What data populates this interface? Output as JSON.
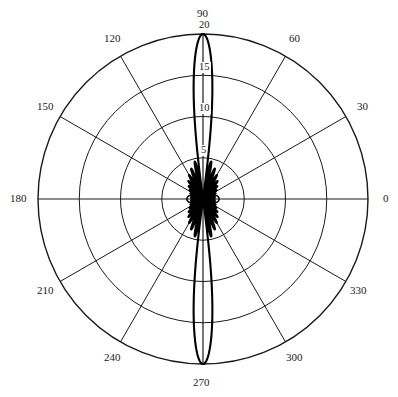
{
  "chart_data": {
    "type": "line",
    "subtype": "polar-radiation-pattern",
    "title": "",
    "xlabel": "",
    "ylabel": "",
    "angular_unit": "degrees",
    "angular_tick_labels": [
      "0",
      "30",
      "60",
      "90",
      "120",
      "150",
      "180",
      "210",
      "240",
      "270",
      "300",
      "330"
    ],
    "angular_ticks": [
      0,
      30,
      60,
      90,
      120,
      150,
      180,
      210,
      240,
      270,
      300,
      330
    ],
    "angular_direction": "counterclockwise",
    "angular_zero_location": "E",
    "radial_tick_labels": [
      "5",
      "10",
      "15",
      "20"
    ],
    "radial_ticks": [
      5,
      10,
      15,
      20
    ],
    "rlim": [
      0,
      20
    ],
    "grid": true,
    "legend": false,
    "series": [
      {
        "name": "radiation pattern",
        "description": "vertically oriented main lobes at 90 and 270 degrees reaching r=20, with multiple minor sidelobes near the origin",
        "main_lobe_peaks_deg": [
          90,
          270
        ],
        "main_lobe_peak_value": 20,
        "main_lobe_half_width_deg": 7.5,
        "sidelobe_peaks_deg": [
          52,
          62,
          72,
          108,
          118,
          128,
          232,
          242,
          252,
          288,
          298,
          308,
          0,
          180
        ],
        "sidelobe_peak_values": [
          4.6,
          3.2,
          2.2,
          4.6,
          3.2,
          2.2,
          4.6,
          3.2,
          2.2,
          4.6,
          3.2,
          2.2,
          1.9,
          1.9
        ],
        "theta_deg": [
          0,
          5,
          10,
          15,
          20,
          25,
          30,
          35,
          40,
          45,
          50,
          55,
          60,
          65,
          70,
          75,
          80,
          82,
          84,
          86,
          88,
          90,
          92,
          94,
          96,
          98,
          100,
          105,
          110,
          115,
          120,
          125,
          130,
          135,
          140,
          145,
          150,
          155,
          160,
          165,
          170,
          175,
          180,
          185,
          190,
          195,
          200,
          205,
          210,
          215,
          220,
          225,
          230,
          235,
          240,
          245,
          250,
          255,
          260,
          262,
          264,
          266,
          268,
          270,
          272,
          274,
          276,
          278,
          280,
          285,
          290,
          295,
          300,
          305,
          310,
          315,
          320,
          325,
          330,
          335,
          340,
          345,
          350,
          355,
          360
        ],
        "r": [
          1.9,
          1.7,
          1.2,
          0.5,
          1.0,
          1.8,
          2.2,
          1.5,
          0.6,
          1.6,
          3.0,
          4.5,
          3.4,
          1.2,
          2.6,
          6.5,
          13.0,
          16.5,
          18.6,
          19.7,
          20.0,
          20.0,
          20.0,
          19.7,
          18.6,
          16.5,
          13.0,
          6.5,
          2.6,
          1.2,
          3.4,
          4.5,
          3.0,
          1.6,
          0.6,
          1.5,
          2.2,
          1.8,
          1.0,
          0.5,
          1.2,
          1.7,
          1.9,
          1.7,
          1.2,
          0.5,
          1.0,
          1.8,
          2.2,
          1.5,
          0.6,
          1.6,
          3.0,
          4.5,
          3.4,
          1.2,
          2.6,
          6.5,
          13.0,
          16.5,
          18.6,
          19.7,
          20.0,
          20.0,
          20.0,
          19.7,
          18.6,
          16.5,
          13.0,
          6.5,
          2.6,
          1.2,
          3.4,
          4.5,
          3.0,
          1.6,
          0.6,
          1.5,
          2.2,
          1.8,
          1.0,
          0.5,
          1.2,
          1.7,
          1.9
        ]
      }
    ],
    "colors": {
      "curve": "#000000",
      "grid": "#1a1a1a",
      "background": "#ffffff"
    }
  },
  "axes": {
    "center_x": 203,
    "center_y": 199,
    "outer_radius": 165,
    "angle_labels": [
      {
        "text": "0",
        "angle": 0,
        "x": 383,
        "y": 193
      },
      {
        "text": "30",
        "angle": 30,
        "x": 357,
        "y": 101
      },
      {
        "text": "60",
        "angle": 60,
        "x": 289,
        "y": 33
      },
      {
        "text": "90",
        "angle": 90,
        "x": 197,
        "y": 8
      },
      {
        "text": "120",
        "angle": 120,
        "x": 104,
        "y": 33
      },
      {
        "text": "150",
        "angle": 150,
        "x": 37,
        "y": 101
      },
      {
        "text": "180",
        "angle": 180,
        "x": 10,
        "y": 193
      },
      {
        "text": "210",
        "angle": 210,
        "x": 37,
        "y": 285
      },
      {
        "text": "240",
        "angle": 240,
        "x": 104,
        "y": 352
      },
      {
        "text": "270",
        "angle": 270,
        "x": 193,
        "y": 377
      },
      {
        "text": "300",
        "angle": 300,
        "x": 286,
        "y": 352
      },
      {
        "text": "330",
        "angle": 330,
        "x": 350,
        "y": 285
      }
    ],
    "radial_labels": [
      {
        "text": "20",
        "radius": 20,
        "x": 198,
        "y": 20
      },
      {
        "text": "15",
        "radius": 15,
        "x": 198,
        "y": 62
      },
      {
        "text": "10",
        "radius": 10,
        "x": 198,
        "y": 103
      },
      {
        "text": "5",
        "radius": 5,
        "x": 200,
        "y": 145
      }
    ]
  }
}
